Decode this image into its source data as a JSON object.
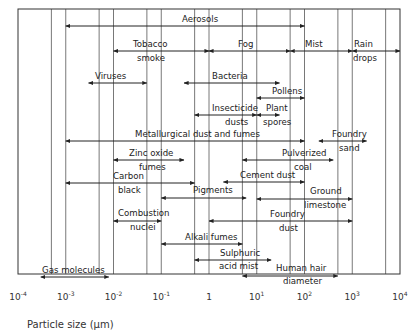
{
  "chart_data": {
    "type": "range-diagram",
    "title": "",
    "xlabel": "Particle size (μm)",
    "xscale": "log",
    "xlim": [
      0.0001,
      10000
    ],
    "x_ticks": [
      {
        "base": "10",
        "exp": "-4",
        "value": 0.0001
      },
      {
        "base": "10",
        "exp": "-3",
        "value": 0.001
      },
      {
        "base": "10",
        "exp": "-2",
        "value": 0.01
      },
      {
        "base": "10",
        "exp": "-1",
        "value": 0.1
      },
      {
        "base": "1",
        "exp": "",
        "value": 1
      },
      {
        "base": "10",
        "exp": "1",
        "value": 10
      },
      {
        "base": "10",
        "exp": "2",
        "value": 100
      },
      {
        "base": "10",
        "exp": "3",
        "value": 1000
      },
      {
        "base": "10",
        "exp": "4",
        "value": 10000
      }
    ],
    "vertical_lines": [
      0.0005,
      0.001,
      0.005,
      0.01,
      0.05,
      0.1,
      0.5,
      1,
      5,
      10,
      50,
      100,
      500,
      1000,
      5000
    ],
    "ranges": [
      {
        "name": "Aerosols",
        "min": 0.001,
        "max": 100,
        "row": 0
      },
      {
        "name": "Tobacco smoke",
        "min": 0.01,
        "max": 1,
        "row": 1
      },
      {
        "name": "Fog",
        "min": 1,
        "max": 50,
        "row": 1
      },
      {
        "name": "Mist",
        "min": 50,
        "max": 1000,
        "row": 1
      },
      {
        "name": "Rain drops",
        "min": 1000,
        "max": 10000,
        "row": 1
      },
      {
        "name": "Viruses",
        "min": 0.003,
        "max": 0.05,
        "row": 2
      },
      {
        "name": "Bacteria",
        "min": 0.3,
        "max": 30,
        "row": 2
      },
      {
        "name": "Pollens",
        "min": 10,
        "max": 100,
        "row": 3
      },
      {
        "name": "Insecticide dusts",
        "min": 0.5,
        "max": 10,
        "row": 4
      },
      {
        "name": "Plant spores",
        "min": 10,
        "max": 30,
        "row": 4
      },
      {
        "name": "Metallurgical dust and fumes",
        "min": 0.001,
        "max": 100,
        "row": 5
      },
      {
        "name": "Foundry sand",
        "min": 200,
        "max": 2000,
        "row": 5
      },
      {
        "name": "Zinc oxide fumes",
        "min": 0.01,
        "max": 0.3,
        "row": 6
      },
      {
        "name": "Pulverized coal",
        "min": 5,
        "max": 400,
        "row": 6
      },
      {
        "name": "Carbon black",
        "min": 0.001,
        "max": 0.5,
        "row": 7
      },
      {
        "name": "Cement dust",
        "min": 2,
        "max": 100,
        "row": 7
      },
      {
        "name": "Pigments",
        "min": 0.1,
        "max": 6,
        "row": 8
      },
      {
        "name": "Ground limestone",
        "min": 10,
        "max": 1000,
        "row": 8
      },
      {
        "name": "Combustion nuclei",
        "min": 0.01,
        "max": 0.1,
        "row": 9
      },
      {
        "name": "Foundry dust",
        "min": 1,
        "max": 1000,
        "row": 9
      },
      {
        "name": "Alkali fumes",
        "min": 0.1,
        "max": 5,
        "row": 10
      },
      {
        "name": "Sulphuric acid mist",
        "min": 0.5,
        "max": 20,
        "row": 11
      },
      {
        "name": "Human hair diameter",
        "min": 5,
        "max": 500,
        "row": 12
      },
      {
        "name": "Gas molecules",
        "min": 0.0003,
        "max": 0.008,
        "row": 12
      }
    ],
    "grid": false,
    "legend": "none"
  },
  "labels": {
    "aerosols": "Aerosols",
    "tobacco_1": "Tobacco",
    "tobacco_2": "smoke",
    "fog": "Fog",
    "mist": "Mist",
    "rain_1": "Rain",
    "rain_2": "drops",
    "viruses": "Viruses",
    "bacteria": "Bacteria",
    "pollens": "Pollens",
    "insecticide_1": "Insecticide",
    "insecticide_2": "dusts",
    "plant_1": "Plant",
    "plant_2": "spores",
    "metallurgical": "Metallurgical dust and fumes",
    "foundry_sand_1": "Foundry",
    "foundry_sand_2": "sand",
    "zinc_1": "Zinc oxide",
    "zinc_2": "fumes",
    "pulverized_1": "Pulverized",
    "pulverized_2": "coal",
    "carbon_1": "Carbon",
    "carbon_2": "black",
    "cement": "Cement dust",
    "pigments": "Pigments",
    "ground_1": "Ground",
    "ground_2": "limestone",
    "combustion_1": "Combustion",
    "combustion_2": "nuclei",
    "foundry_dust_1": "Foundry",
    "foundry_dust_2": "dust",
    "alkali": "Alkali fumes",
    "sulphuric_1": "Sulphuric",
    "sulphuric_2": "acid mist",
    "hair_1": "Human hair",
    "hair_2": "diameter",
    "gas": "Gas molecules"
  }
}
